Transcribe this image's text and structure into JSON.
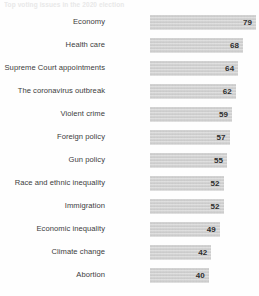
{
  "header": {
    "title": "Top voting issues in the 2020 election"
  },
  "chart_data": {
    "type": "bar",
    "title": "Top voting issues in the 2020 election",
    "orientation": "horizontal",
    "xlabel": "",
    "ylabel": "",
    "xlim": [
      0,
      100
    ],
    "grid": false,
    "legend": false,
    "value_labels": true,
    "bar_color": "#d2d2d2",
    "categories": [
      "Economy",
      "Health care",
      "Supreme Court appointments",
      "The coronavirus outbreak",
      "Violent crime",
      "Foreign policy",
      "Gun policy",
      "Race and ethnic inequality",
      "Immigration",
      "Economic inequality",
      "Climate change",
      "Abortion"
    ],
    "values": [
      79,
      68,
      64,
      62,
      59,
      57,
      55,
      52,
      52,
      49,
      42,
      40
    ]
  },
  "rows": [
    {
      "label": "Economy",
      "value": "79",
      "width_pct": 100.0
    },
    {
      "label": "Health care",
      "value": "68",
      "width_pct": 87.8
    },
    {
      "label": "Supreme Court appointments",
      "value": "64",
      "width_pct": 83.2
    },
    {
      "label": "The coronavirus outbreak",
      "value": "62",
      "width_pct": 80.9
    },
    {
      "label": "Violent crime",
      "value": "59",
      "width_pct": 77.4
    },
    {
      "label": "Foreign policy",
      "value": "57",
      "width_pct": 75.1
    },
    {
      "label": "Gun policy",
      "value": "55",
      "width_pct": 72.8
    },
    {
      "label": "Race and ethnic inequality",
      "value": "52",
      "width_pct": 69.4
    },
    {
      "label": "Immigration",
      "value": "52",
      "width_pct": 69.4
    },
    {
      "label": "Economic inequality",
      "value": "49",
      "width_pct": 65.9
    },
    {
      "label": "Climate change",
      "value": "42",
      "width_pct": 57.8
    },
    {
      "label": "Abortion",
      "value": "40",
      "width_pct": 55.5
    }
  ]
}
